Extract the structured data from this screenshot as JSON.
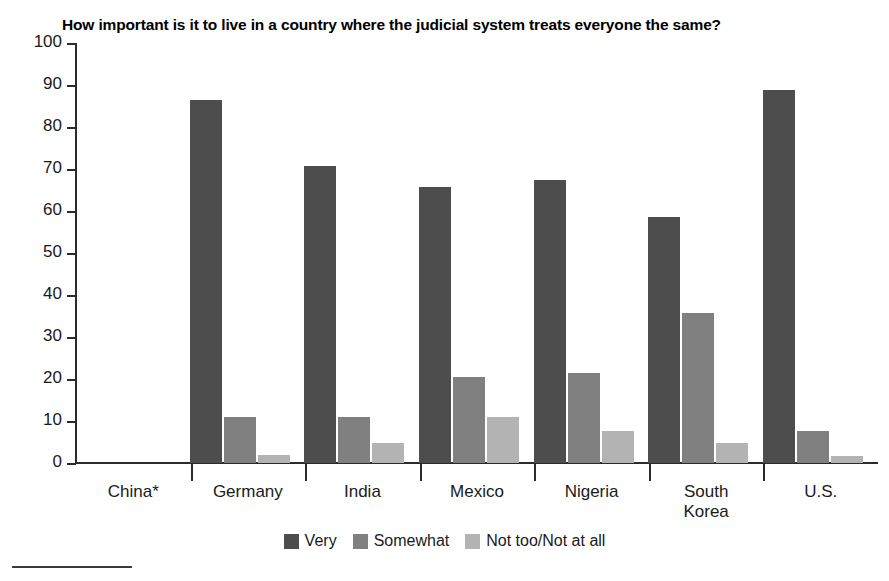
{
  "chart_data": {
    "type": "bar",
    "title": "How important is it to live in a country where the judicial system treats everyone the same?",
    "xlabel": "",
    "ylabel": "",
    "ylim": [
      0,
      100
    ],
    "ytick_step": 10,
    "grid": false,
    "legend_position": "bottom-center",
    "categories": [
      "China*",
      "Germany",
      "India",
      "Mexico",
      "Nigeria",
      "South\nKorea",
      "U.S."
    ],
    "series": [
      {
        "name": "Very",
        "color": "#4d4d4d",
        "values": [
          null,
          86.5,
          70.7,
          65.7,
          67.5,
          58.5,
          88.8
        ]
      },
      {
        "name": "Somewhat",
        "color": "#808080",
        "values": [
          null,
          10.9,
          10.9,
          20.5,
          21.5,
          35.6,
          7.7
        ]
      },
      {
        "name": "Not too/Not at all",
        "color": "#b3b3b3",
        "values": [
          null,
          1.8,
          4.8,
          11.0,
          7.7,
          4.7,
          1.6
        ]
      }
    ],
    "ytick_labels": [
      "100",
      "90",
      "80",
      "70",
      "60",
      "50",
      "40",
      "30",
      "20",
      "10",
      "0"
    ]
  },
  "axis": {
    "y_labels": [
      "100",
      "90",
      "80",
      "70",
      "60",
      "50",
      "40",
      "30",
      "20",
      "10",
      "0"
    ]
  },
  "legend": {
    "items": [
      {
        "label": "Very",
        "color": "#4d4d4d"
      },
      {
        "label": "Somewhat",
        "color": "#808080"
      },
      {
        "label": "Not too/Not at all",
        "color": "#b3b3b3"
      }
    ]
  },
  "categories": [
    {
      "label": "China*"
    },
    {
      "label": "Germany"
    },
    {
      "label": "India"
    },
    {
      "label": "Mexico"
    },
    {
      "label": "Nigeria"
    },
    {
      "label": "South Korea"
    },
    {
      "label": "U.S."
    }
  ]
}
